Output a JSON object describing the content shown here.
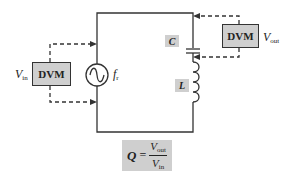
{
  "diagram": {
    "type": "circuit",
    "colors": {
      "wire": "#333333",
      "box_fill": "#cfcfcf",
      "background": "#ffffff"
    },
    "left_meter": {
      "label": "DVM",
      "variable": "V",
      "subscript": "in"
    },
    "right_meter": {
      "label": "DVM",
      "variable": "V",
      "subscript": "out"
    },
    "source": {
      "icon": "ac-source-icon",
      "label": "f",
      "subscript": "r"
    },
    "capacitor": {
      "label": "C"
    },
    "inductor": {
      "label": "L"
    },
    "formula": {
      "lhs": "Q",
      "equals": "=",
      "num_var": "V",
      "num_sub": "out",
      "den_var": "V",
      "den_sub": "in"
    }
  }
}
